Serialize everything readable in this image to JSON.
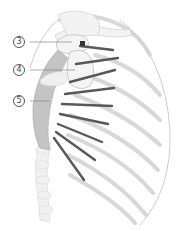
{
  "figure": {
    "colors": {
      "bone_light": "#ececec",
      "bone_outline": "#cfcfcf",
      "bone_mid": "#d9d9d9",
      "muscle_dark": "#555555",
      "muscle_band": "#bdbdbd",
      "leader_line": "#777777",
      "highlight_point": "#333333"
    },
    "callouts": [
      {
        "label": "3"
      },
      {
        "label": "4"
      },
      {
        "label": "5"
      }
    ]
  }
}
